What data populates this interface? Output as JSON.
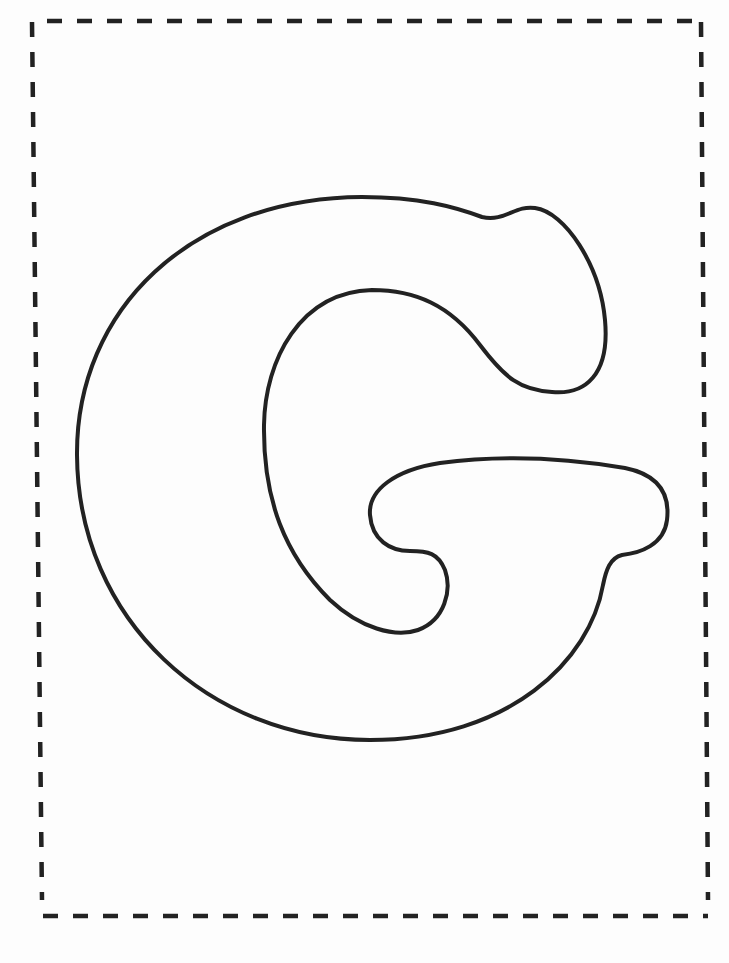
{
  "page": {
    "type": "printable coloring page",
    "letter": "G",
    "background_color": "#fdfdfd",
    "outline_color": "#222222",
    "border_color": "#222222",
    "border_style": "dashed"
  }
}
